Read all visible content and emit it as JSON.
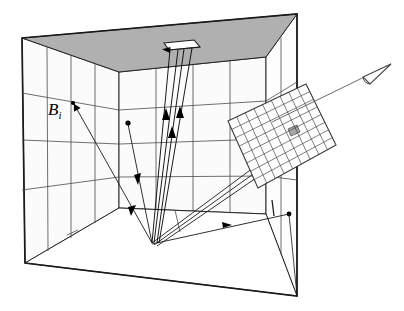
{
  "figure": {
    "background_color": "#ffffff",
    "line_color": "#1a1a1a",
    "grid_line_color": "#555555",
    "ceiling_fill": "#b0b0b0",
    "wall_fill": "#fbfbfb",
    "highlight_cell_fill": "#a8a8a8",
    "width": 404,
    "height": 311
  },
  "labels": {
    "radiosity": {
      "text": "B",
      "subscript": "i",
      "x": 48,
      "y": 110
    }
  },
  "icons": {
    "eye": "eye-icon",
    "light_source": "light-source-icon",
    "image_plane": "image-plane-grid-icon",
    "patch_point": "surface-patch-point-icon"
  },
  "geometry": {
    "outer_box": {
      "top_left": [
        22,
        38
      ],
      "top_right": [
        297,
        14
      ],
      "bottom_right": [
        297,
        296
      ],
      "bottom_left": [
        25,
        263
      ]
    },
    "room_back_wall": {
      "top_left": [
        119,
        72
      ],
      "top_right": [
        266,
        57
      ],
      "bottom_right": [
        266,
        214
      ],
      "bottom_left": [
        119,
        208
      ]
    },
    "ceiling_polygon": "22,38 297,14 266,57 119,72",
    "light_source_quad": "164,43 194,40 199,46 168,49",
    "convergence_point": [
      152,
      243
    ],
    "right_endpoint": [
      289,
      214
    ],
    "grid_plane": {
      "corners": [
        [
          228,
          121
        ],
        [
          306,
          84
        ],
        [
          336,
          145
        ],
        [
          258,
          188
        ]
      ],
      "columns": 9,
      "rows": 8,
      "highlight_cell": {
        "col": 6,
        "row": 3
      }
    },
    "eye": {
      "apex": [
        391,
        64
      ],
      "position": [
        364,
        77
      ]
    }
  },
  "rays": {
    "light_rays_up": 3,
    "reflected_rays": 2,
    "view_rays": 2,
    "arrow_count": 6
  }
}
